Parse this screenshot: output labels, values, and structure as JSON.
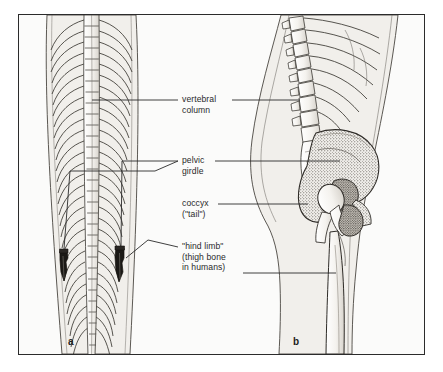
{
  "figure": {
    "frame_color": "#2b2b2b",
    "background_color": "#fbfbfa",
    "ink_color": "#2a2a2a"
  },
  "labels": [
    {
      "id": "vertebral",
      "line1": "vertebral",
      "line2": "column",
      "line3": ""
    },
    {
      "id": "pelvic",
      "line1": "pelvic",
      "line2": "girdle",
      "line3": ""
    },
    {
      "id": "coccyx",
      "line1": "coccyx",
      "line2": "(\"tail\")",
      "line3": ""
    },
    {
      "id": "hind",
      "line1": "\"hind limb\"",
      "line2": "(thigh bone",
      "line3": "in humans)"
    }
  ],
  "panels": [
    {
      "letter": "a",
      "subject": "snake skeleton, dorsal view"
    },
    {
      "letter": "b",
      "subject": "human skeleton, lateral view"
    }
  ]
}
